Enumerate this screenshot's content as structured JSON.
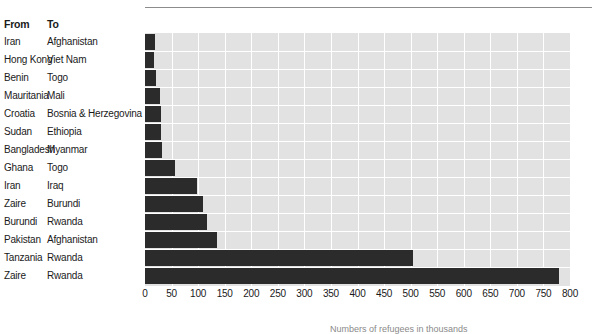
{
  "table": {
    "header": {
      "from": "From",
      "to": "To"
    },
    "rows": [
      {
        "from": "Iran",
        "to": "Afghanistan"
      },
      {
        "from": "Hong Kong",
        "to": "Viet Nam"
      },
      {
        "from": "Benin",
        "to": "Togo"
      },
      {
        "from": "Mauritania",
        "to": "Mali"
      },
      {
        "from": "Croatia",
        "to": "Bosnia & Herzegovina"
      },
      {
        "from": "Sudan",
        "to": "Ethiopia"
      },
      {
        "from": "Bangladesh",
        "to": "Myanmar"
      },
      {
        "from": "Ghana",
        "to": "Togo"
      },
      {
        "from": "Iran",
        "to": "Iraq"
      },
      {
        "from": "Zaire",
        "to": "Burundi"
      },
      {
        "from": "Burundi",
        "to": "Rwanda"
      },
      {
        "from": "Pakistan",
        "to": "Afghanistan"
      },
      {
        "from": "Tanzania",
        "to": "Rwanda"
      },
      {
        "from": "Zaire",
        "to": "Rwanda"
      }
    ]
  },
  "colors": {
    "bar": "#2b2b2b",
    "plot_background": "#e2e2e2",
    "gridline": "#ffffff",
    "rule": "#8c8c8c",
    "text": "#1a1a1a"
  },
  "footnote": {
    "text": "Numbers of refugees in thousands"
  },
  "chart_data": {
    "type": "bar",
    "orientation": "horizontal",
    "title": "",
    "xlabel": "",
    "ylabel": "",
    "xlim": [
      0,
      800
    ],
    "xticks": [
      0,
      50,
      100,
      150,
      200,
      250,
      300,
      350,
      400,
      450,
      500,
      550,
      600,
      650,
      700,
      750,
      800
    ],
    "xtick_labels": [
      "0",
      "50",
      "100",
      "150",
      "200",
      "250",
      "300",
      "350",
      "400",
      "450",
      "500",
      "550",
      "600",
      "650",
      "700",
      "750",
      "800"
    ],
    "grid": true,
    "grid_axis": "both",
    "legend": false,
    "categories": [
      "Iran → Afghanistan",
      "Hong Kong → Viet Nam",
      "Benin → Togo",
      "Mauritania → Mali",
      "Croatia → Bosnia & Herzegovina",
      "Sudan → Ethiopia",
      "Bangladesh → Myanmar",
      "Ghana → Togo",
      "Iran → Iraq",
      "Zaire → Burundi",
      "Burundi → Rwanda",
      "Pakistan → Afghanistan",
      "Tanzania → Rwanda",
      "Zaire → Rwanda"
    ],
    "values": [
      19,
      17,
      21,
      28,
      30,
      30,
      32,
      57,
      98,
      110,
      117,
      135,
      505,
      780
    ]
  }
}
